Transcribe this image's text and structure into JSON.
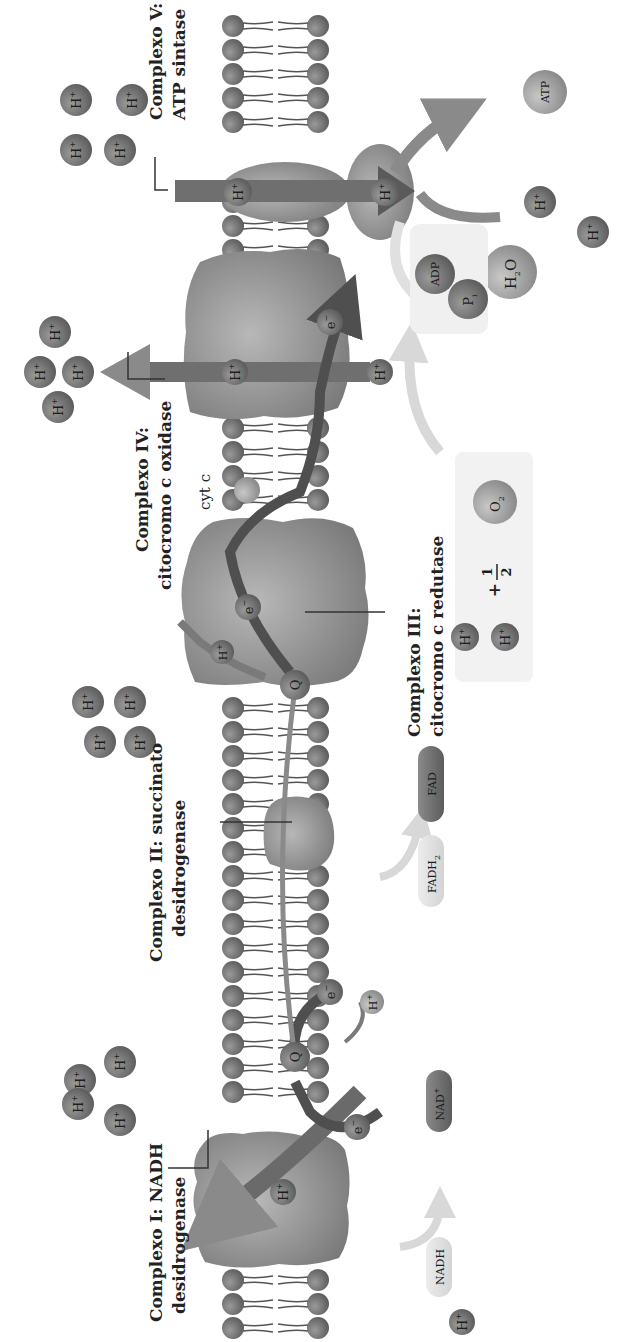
{
  "diagram": {
    "orientation": "rotated 90deg clockwise",
    "labels": {
      "complex1_line1": "Complexo I: NADH",
      "complex1_line2": "desidrogenase",
      "complex2_line1": "Complexo II: succinato",
      "complex2_line2": "desidrogenase",
      "complex3_line1": "Complexo III:",
      "complex3_line2": "citocromo c redutase",
      "complex4_line1": "Complexo IV:",
      "complex4_line2": "citocromo c oxidase",
      "complex5_line1": "Complexo V:",
      "complex5_line2": "ATP sintase",
      "cytc": "cyt c"
    },
    "molecules": {
      "proton": "H",
      "proton_charge": "+",
      "electron": "e",
      "electron_charge": "−",
      "ubiquinone": "Q",
      "nadh": "NADH",
      "nad": "NAD",
      "nad_charge": "+",
      "fadh2": "FADH",
      "fadh2_sub": "2",
      "fad": "FAD",
      "o2": "O",
      "o2_sub": "2",
      "h2o_h": "H",
      "h2o_sub": "2",
      "h2o_o": "O",
      "adp": "ADP",
      "pi": "P",
      "pi_sub": "i",
      "atp": "ATP",
      "plus": "+",
      "half_num": "1",
      "half_den": "2"
    },
    "colors": {
      "protein": "#8e8e8e",
      "lipid_head": "#7a7a7a",
      "proton_ball": "#6e6e6e",
      "arrow_dark": "#4f4f4f",
      "arrow_mid": "#7d7d7d",
      "arrow_light": "#d6d6d6",
      "box_light": "#f1f1f1",
      "background": "#ffffff"
    }
  }
}
